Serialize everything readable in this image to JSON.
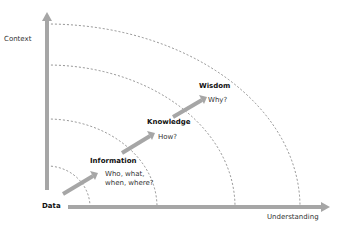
{
  "diagram": {
    "axes": {
      "y_label": "Context",
      "x_label": "Understanding",
      "origin_label": "Data"
    },
    "stages": [
      {
        "name": "Information",
        "question_line1": "Who, what,",
        "question_line2": "when, where?"
      },
      {
        "name": "Knowledge",
        "question_line1": "How?"
      },
      {
        "name": "Wisdom",
        "question_line1": "Why?"
      }
    ],
    "colors": {
      "axis": "#a6a6a6",
      "arrow": "#a6a6a6",
      "arc": "#666666",
      "text": "#333333"
    }
  }
}
